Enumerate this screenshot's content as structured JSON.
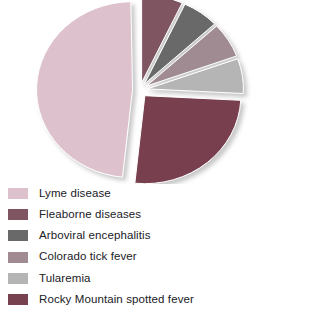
{
  "chart_data": {
    "type": "pie",
    "title": "",
    "subtitle": "",
    "xlabel": "",
    "ylabel": "",
    "exploded": true,
    "legend_position": "bottom-left",
    "grid": false,
    "categories": [
      "Lyme disease",
      "Fleaborne diseases",
      "Arboviral encephalitis",
      "Colorado tick fever",
      "Tularemia",
      "Rocky Mountain spotted fever"
    ],
    "values": [
      48,
      7,
      6,
      7,
      7,
      25
    ],
    "colors": [
      "#ddc2ce",
      "#7e5561",
      "#696969",
      "#a08b93",
      "#b5b5b5",
      "#78414f"
    ],
    "slices": [
      {
        "label": "Lyme disease",
        "value": 48,
        "color": "#ddc2ce",
        "start_angle": 186,
        "end_angle": 359
      },
      {
        "label": "Fleaborne diseases",
        "value": 7,
        "color": "#7e5561",
        "start_angle": 0,
        "end_angle": 25
      },
      {
        "label": "Arboviral encephalitis",
        "value": 6,
        "color": "#696969",
        "start_angle": 25,
        "end_angle": 47
      },
      {
        "label": "Colorado tick fever",
        "value": 7,
        "color": "#a08b93",
        "start_angle": 47,
        "end_angle": 70
      },
      {
        "label": "Tularemia",
        "value": 7,
        "color": "#b5b5b5",
        "start_angle": 70,
        "end_angle": 93
      },
      {
        "label": "Rocky Mountain spotted fever",
        "value": 25,
        "color": "#78414f",
        "start_angle": 93,
        "end_angle": 186
      }
    ]
  },
  "legend": {
    "items": [
      {
        "label": "Lyme disease",
        "color": "#ddc2ce",
        "name": "lyme-disease"
      },
      {
        "label": "Fleaborne diseases",
        "color": "#7e5561",
        "name": "fleaborne-diseases"
      },
      {
        "label": "Arboviral encephalitis",
        "color": "#696969",
        "name": "arboviral-encephalitis"
      },
      {
        "label": "Colorado tick fever",
        "color": "#a08b93",
        "name": "colorado-tick-fever"
      },
      {
        "label": "Tularemia",
        "color": "#b5b5b5",
        "name": "tularemia"
      },
      {
        "label": "Rocky Mountain spotted fever",
        "color": "#78414f",
        "name": "rocky-mountain-spotted-fever"
      }
    ]
  }
}
